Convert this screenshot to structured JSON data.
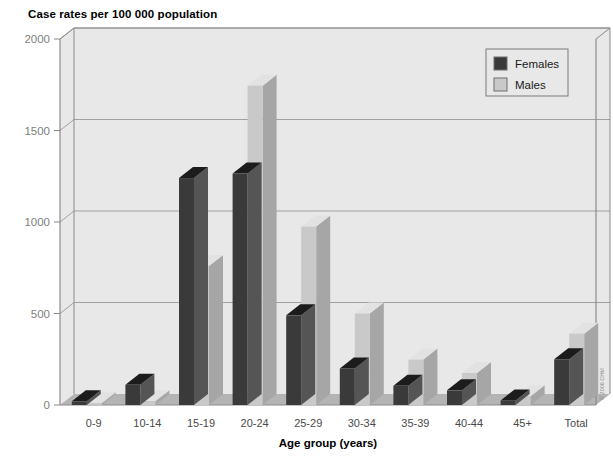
{
  "chart_data": {
    "type": "bar",
    "title": "Case rates per 100 000 population",
    "xlabel": "Age group (years)",
    "ylabel": "",
    "ylim": [
      0,
      2000
    ],
    "yticks": [
      "0",
      "500",
      "1000",
      "1500",
      "2000"
    ],
    "grid": true,
    "legend_position": "top-right",
    "categories": [
      "0-9",
      "10-14",
      "15-19",
      "20-24",
      "25-29",
      "30-34",
      "35-39",
      "40-44",
      "45+",
      "Total"
    ],
    "series": [
      {
        "name": "Females",
        "color": "#3a3a3a",
        "values": [
          20,
          110,
          1240,
          1265,
          490,
          200,
          105,
          80,
          25,
          250
        ]
      },
      {
        "name": "Males",
        "color": "#c9c9c9",
        "values": [
          10,
          20,
          760,
          1745,
          975,
          500,
          248,
          175,
          48,
          390
        ]
      }
    ]
  },
  "legend": {
    "items": [
      {
        "label": "Females",
        "swatch": "#3a3a3a"
      },
      {
        "label": "Males",
        "swatch": "#c9c9c9"
      }
    ]
  },
  "credit": {
    "text": "© 2006  CHM"
  },
  "colors": {
    "plot_background": "#e8e8e8",
    "floor": "#b4b4b4",
    "gridline": "#a0a0a0",
    "axis": "#8a8a8a",
    "female_front": "#3a3a3a",
    "female_top": "#1c1c1c",
    "female_side": "#555555",
    "male_front": "#c9c9c9",
    "male_top": "#e2e2e2",
    "male_side": "#a6a6a6"
  }
}
